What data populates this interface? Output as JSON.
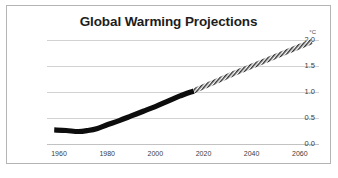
{
  "figure": {
    "title": "Global Warming Projections",
    "border_color": "#b4b4b4",
    "background": "#ffffff"
  },
  "chart_data": {
    "type": "line",
    "title": "Global Warming Projections",
    "xlabel": "",
    "ylabel": "°C",
    "y_unit": "°C",
    "xlim": [
      1955,
      2068
    ],
    "ylim": [
      0.0,
      2.0
    ],
    "grid": "horizontal",
    "legend": "none",
    "yticks": [
      "0.0",
      "0.5",
      "1.0",
      "1.5",
      "2.0"
    ],
    "ytick_values": [
      0.0,
      0.5,
      1.0,
      1.5,
      2.0
    ],
    "xticks": [
      "1960",
      "1980",
      "2000",
      "2020",
      "2040",
      "2060"
    ],
    "xtick_values": [
      1960,
      1980,
      2000,
      2020,
      2040,
      2060
    ],
    "series": [
      {
        "name": "Observed",
        "style": "solid-band",
        "color": "#0d0d0d",
        "x": [
          1958,
          1963,
          1968,
          1972,
          1976,
          1980,
          1985,
          1990,
          1995,
          2000,
          2005,
          2010,
          2016
        ],
        "values": [
          0.27,
          0.26,
          0.24,
          0.26,
          0.3,
          0.37,
          0.45,
          0.54,
          0.63,
          0.72,
          0.82,
          0.92,
          1.02
        ]
      },
      {
        "name": "Projected",
        "style": "hatched-band",
        "color": "#5a5a5a",
        "x": [
          2016,
          2025,
          2035,
          2045,
          2055,
          2065
        ],
        "values": [
          1.02,
          1.2,
          1.4,
          1.59,
          1.78,
          1.97
        ]
      }
    ]
  }
}
